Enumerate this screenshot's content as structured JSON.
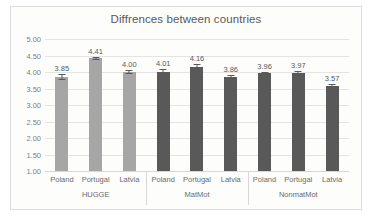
{
  "chart_data": {
    "type": "bar",
    "title": "Diffrences between countries",
    "xlabel": "",
    "ylabel": "",
    "ylim": [
      1.0,
      5.0
    ],
    "ytick_labels": [
      "5.00",
      "4.50",
      "4.00",
      "3.50",
      "3.00",
      "2.50",
      "2.00",
      "1.50",
      "1.00"
    ],
    "ytick_values": [
      5.0,
      4.5,
      4.0,
      3.5,
      3.0,
      2.5,
      2.0,
      1.5,
      1.0
    ],
    "grid": true,
    "legend": "none",
    "categories": [
      "Poland",
      "Portugal",
      "Latvia",
      "Poland",
      "Portugal",
      "Latvia",
      "Poland",
      "Portugal",
      "Latvia"
    ],
    "values": [
      3.85,
      4.41,
      4.0,
      4.01,
      4.16,
      3.86,
      3.96,
      3.97,
      3.57
    ],
    "data_labels": [
      "3.85",
      "4.41",
      "4.00",
      "4.01",
      "4.16",
      "3.86",
      "3.96",
      "3.97",
      "3.57"
    ],
    "error_bars": [
      0.09,
      0.06,
      0.06,
      0.07,
      0.07,
      0.06,
      0.05,
      0.05,
      0.06
    ],
    "bar_colors": [
      "#a6a6a6",
      "#a6a6a6",
      "#a6a6a6",
      "#595959",
      "#595959",
      "#595959",
      "#595959",
      "#595959",
      "#595959"
    ],
    "groups": [
      {
        "label": "HUGGE",
        "start": 0,
        "span": 3
      },
      {
        "label": "MatMot",
        "start": 3,
        "span": 3
      },
      {
        "label": "NonmatMot",
        "start": 6,
        "span": 3
      }
    ],
    "colors": {
      "series_light": "#a6a6a6",
      "series_dark": "#595959",
      "grid": "#e4e4e4",
      "text": "#595959",
      "tick_text": "#7f7f7f",
      "plot_background": "#fdfdfc",
      "border": "#dcdcdc"
    }
  }
}
